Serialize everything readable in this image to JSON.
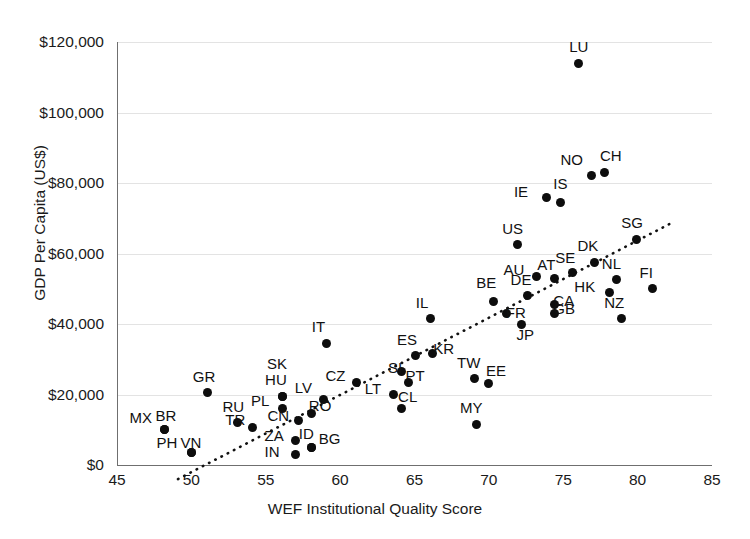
{
  "chart_data": {
    "type": "scatter",
    "title": "",
    "xlabel": "WEF Institutional Quality Score",
    "ylabel": "GDP Per Capita (US$)",
    "xlim": [
      45,
      85
    ],
    "ylim": [
      0,
      120000
    ],
    "xticks": [
      45,
      50,
      55,
      60,
      65,
      70,
      75,
      80,
      85
    ],
    "xtick_labels": [
      "45",
      "50",
      "55",
      "60",
      "65",
      "70",
      "75",
      "80",
      "85"
    ],
    "yticks": [
      0,
      20000,
      40000,
      60000,
      80000,
      100000,
      120000
    ],
    "ytick_labels": [
      "$0",
      "$20,000",
      "$40,000",
      "$60,000",
      "$80,000",
      "$100,000",
      "$120,000"
    ],
    "grid": true,
    "legend": "none",
    "marker_color": "#0d0d0d",
    "trendline": {
      "type": "linear-dotted",
      "x0": 49.1,
      "y0": -4000,
      "x1": 82.2,
      "y1": 68500
    },
    "points": [
      {
        "label": "LU",
        "x": 76.0,
        "y": 114000,
        "lx": 0,
        "ly": -18
      },
      {
        "label": "CH",
        "x": 77.8,
        "y": 83000,
        "lx": 4,
        "ly": -18
      },
      {
        "label": "NO",
        "x": 76.9,
        "y": 82000,
        "lx": -22,
        "ly": -18
      },
      {
        "label": "IS",
        "x": 74.8,
        "y": 74500,
        "lx": 2,
        "ly": -20
      },
      {
        "label": "IE",
        "x": 73.9,
        "y": 76000,
        "lx": -24,
        "ly": -7
      },
      {
        "label": "SG",
        "x": 79.9,
        "y": 64000,
        "lx": -6,
        "ly": -18
      },
      {
        "label": "US",
        "x": 71.9,
        "y": 62500,
        "lx": -6,
        "ly": -18
      },
      {
        "label": "DK",
        "x": 77.1,
        "y": 57500,
        "lx": -8,
        "ly": -18
      },
      {
        "label": "SE",
        "x": 75.6,
        "y": 54500,
        "lx": -8,
        "ly": -17
      },
      {
        "label": "AT",
        "x": 74.4,
        "y": 53000,
        "lx": -8,
        "ly": -15
      },
      {
        "label": "AU",
        "x": 73.2,
        "y": 53500,
        "lx": -24,
        "ly": -8
      },
      {
        "label": "NL",
        "x": 78.6,
        "y": 52500,
        "lx": -6,
        "ly": -18
      },
      {
        "label": "FI",
        "x": 81.0,
        "y": 50000,
        "lx": -4,
        "ly": -18
      },
      {
        "label": "HK",
        "x": 78.1,
        "y": 49000,
        "lx": -26,
        "ly": -7
      },
      {
        "label": "DE",
        "x": 72.6,
        "y": 48000,
        "lx": -8,
        "ly": -18
      },
      {
        "label": "BE",
        "x": 70.3,
        "y": 46500,
        "lx": -8,
        "ly": -20
      },
      {
        "label": "CA",
        "x": 74.4,
        "y": 45500,
        "lx": 8,
        "ly": -6
      },
      {
        "label": "GB",
        "x": 74.4,
        "y": 43000,
        "lx": 8,
        "ly": -6
      },
      {
        "label": "NZ",
        "x": 78.9,
        "y": 41500,
        "lx": -8,
        "ly": -18
      },
      {
        "label": "IL",
        "x": 66.1,
        "y": 41500,
        "lx": -6,
        "ly": -18
      },
      {
        "label": "FR",
        "x": 71.2,
        "y": 43000,
        "lx": 8,
        "ly": -2
      },
      {
        "label": "JP",
        "x": 72.2,
        "y": 40000,
        "lx": 4,
        "ly": 9
      },
      {
        "label": "IT",
        "x": 59.1,
        "y": 34500,
        "lx": -6,
        "ly": -18
      },
      {
        "label": "KR",
        "x": 66.2,
        "y": 31500,
        "lx": 10,
        "ly": -7
      },
      {
        "label": "ES",
        "x": 65.1,
        "y": 31000,
        "lx": -10,
        "ly": -18
      },
      {
        "label": "TW",
        "x": 69.0,
        "y": 24500,
        "lx": -8,
        "ly": -18
      },
      {
        "label": "EE",
        "x": 70.0,
        "y": 23000,
        "lx": 6,
        "ly": -15
      },
      {
        "label": "SI",
        "x": 64.1,
        "y": 26500,
        "lx": -4,
        "ly": -6
      },
      {
        "label": "PT",
        "x": 64.6,
        "y": 23500,
        "lx": 6,
        "ly": -8
      },
      {
        "label": "CZ",
        "x": 61.1,
        "y": 23500,
        "lx": -22,
        "ly": -8
      },
      {
        "label": "LT",
        "x": 63.6,
        "y": 20000,
        "lx": -20,
        "ly": -8
      },
      {
        "label": "CL",
        "x": 64.1,
        "y": 16000,
        "lx": 6,
        "ly": -14
      },
      {
        "label": "SK",
        "x": 56.1,
        "y": 19500,
        "lx": -6,
        "ly": -34
      },
      {
        "label": "HU",
        "x": 56.1,
        "y": 19500,
        "lx": -8,
        "ly": -18
      },
      {
        "label": "LV",
        "x": 58.9,
        "y": 18500,
        "lx": -20,
        "ly": -14
      },
      {
        "label": "RO",
        "x": 58.1,
        "y": 14500,
        "lx": 6,
        "ly": -10
      },
      {
        "label": "PL",
        "x": 56.1,
        "y": 16000,
        "lx": -22,
        "ly": -10
      },
      {
        "label": "GR",
        "x": 51.1,
        "y": 20500,
        "lx": -6,
        "ly": -18
      },
      {
        "label": "RU",
        "x": 53.1,
        "y": 12000,
        "lx": -6,
        "ly": -18
      },
      {
        "label": "TR",
        "x": 54.1,
        "y": 10500,
        "lx": -18,
        "ly": -10
      },
      {
        "label": "CN",
        "x": 57.2,
        "y": 12500,
        "lx": -22,
        "ly": -7
      },
      {
        "label": "MX",
        "x": 48.2,
        "y": 10000,
        "lx": -26,
        "ly": -14
      },
      {
        "label": "BR",
        "x": 48.2,
        "y": 10000,
        "lx": 0,
        "ly": -16
      },
      {
        "label": "ZA",
        "x": 57.0,
        "y": 7000,
        "lx": -22,
        "ly": -6
      },
      {
        "label": "ID",
        "x": 58.1,
        "y": 5000,
        "lx": -4,
        "ly": -15
      },
      {
        "label": "BG",
        "x": 58.1,
        "y": 5000,
        "lx": 16,
        "ly": -10
      },
      {
        "label": "IN",
        "x": 57.0,
        "y": 3000,
        "lx": -22,
        "ly": -4
      },
      {
        "label": "PH",
        "x": 50.0,
        "y": 3500,
        "lx": -26,
        "ly": -12
      },
      {
        "label": "VN",
        "x": 50.0,
        "y": 3500,
        "lx": -2,
        "ly": -12
      },
      {
        "label": "MY",
        "x": 69.2,
        "y": 11500,
        "lx": -8,
        "ly": -18
      }
    ]
  }
}
